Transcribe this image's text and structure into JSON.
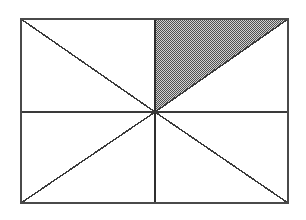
{
  "figure": {
    "title": "Rectangle divided by midlines and diagonals with one shaded triangle",
    "type": "geometric-diagram",
    "canvas": {
      "width": 306,
      "height": 220,
      "background_color": "#ffffff"
    },
    "colors": {
      "stroke": "#3a3a3a",
      "border_stroke": "#4a4a4a",
      "shade_dark": "#555555",
      "shade_light": "#cfcfcf",
      "fill_white": "#ffffff"
    },
    "rectangle": {
      "name": "outer-rectangle",
      "left": 21,
      "top": 19,
      "right": 288,
      "bottom": 203,
      "width": 267,
      "height": 184,
      "stroke_width": 2
    },
    "center_point": {
      "name": "center-vertex",
      "x": 155,
      "y": 112
    },
    "corners": [
      {
        "name": "top-left",
        "x": 21,
        "y": 19
      },
      {
        "name": "top-right",
        "x": 288,
        "y": 19
      },
      {
        "name": "bottom-right",
        "x": 288,
        "y": 203
      },
      {
        "name": "bottom-left",
        "x": 21,
        "y": 203
      }
    ],
    "midpoints": [
      {
        "name": "top-midpoint",
        "x": 155,
        "y": 19
      },
      {
        "name": "right-midpoint",
        "x": 288,
        "y": 112
      },
      {
        "name": "bottom-midpoint",
        "x": 155,
        "y": 203
      },
      {
        "name": "left-midpoint",
        "x": 21,
        "y": 112
      }
    ],
    "lines": [
      {
        "name": "horizontal-midline",
        "x1": 21,
        "y1": 112,
        "x2": 288,
        "y2": 112,
        "stroke_width": 1.6
      },
      {
        "name": "vertical-midline-upper",
        "x1": 155,
        "y1": 19,
        "x2": 155,
        "y2": 112,
        "stroke_width": 1.8
      },
      {
        "name": "vertical-midline-lower",
        "x1": 155,
        "y1": 112,
        "x2": 155,
        "y2": 203,
        "stroke_width": 1.8
      },
      {
        "name": "diagonal-center-to-top-left",
        "x1": 155,
        "y1": 112,
        "x2": 21,
        "y2": 19,
        "stroke_width": 1.5
      },
      {
        "name": "diagonal-center-to-top-right",
        "x1": 155,
        "y1": 112,
        "x2": 288,
        "y2": 19,
        "stroke_width": 1.5
      },
      {
        "name": "diagonal-center-to-bottom-right",
        "x1": 155,
        "y1": 112,
        "x2": 288,
        "y2": 203,
        "stroke_width": 1.5
      },
      {
        "name": "diagonal-center-to-bottom-left",
        "x1": 155,
        "y1": 112,
        "x2": 21,
        "y2": 203,
        "stroke_width": 1.5
      }
    ],
    "shaded_region": {
      "name": "shaded-triangle",
      "fill_pattern": "checkerboard-dither-50-percent",
      "vertices": [
        {
          "x": 155,
          "y": 19
        },
        {
          "x": 288,
          "y": 19
        },
        {
          "x": 155,
          "y": 112
        }
      ],
      "points_attr": "155,19 288,19 155,112",
      "location_description": "upper-right quadrant, above the diagonal from center to top-right corner"
    },
    "unshaded_regions": [
      {
        "name": "region-upper-left-upper",
        "points_attr": "21,19 155,19 155,112"
      },
      {
        "name": "region-upper-left-lower",
        "points_attr": "21,19 155,112 21,112"
      },
      {
        "name": "region-upper-right-lower",
        "points_attr": "155,112 288,19 288,112"
      },
      {
        "name": "region-lower-left-upper",
        "points_attr": "21,112 155,112 21,203"
      },
      {
        "name": "region-lower-left-lower",
        "points_attr": "21,203 155,112 155,203"
      },
      {
        "name": "region-lower-right-upper",
        "points_attr": "155,112 288,112 288,203"
      },
      {
        "name": "region-lower-right-lower",
        "points_attr": "155,112 288,203 155,203"
      }
    ]
  }
}
